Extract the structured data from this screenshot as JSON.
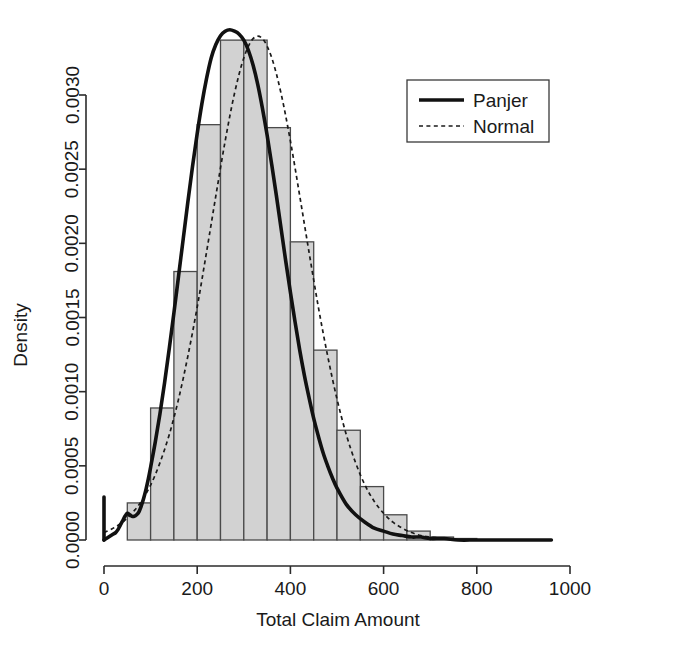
{
  "chart_data": {
    "type": "bar",
    "title": "",
    "xlabel": "Total Claim Amount",
    "ylabel": "Density",
    "xlim": [
      0,
      1000
    ],
    "ylim": [
      0,
      0.0034
    ],
    "grid": false,
    "legend_position": "top-right",
    "x_ticks": [
      0,
      200,
      400,
      600,
      800,
      1000
    ],
    "x_tick_labels": [
      "0",
      "200",
      "400",
      "600",
      "800",
      "1000"
    ],
    "y_ticks": [
      0.0,
      0.0005,
      0.001,
      0.0015,
      0.002,
      0.0025,
      0.003
    ],
    "y_tick_labels": [
      "0.0000",
      "0.0005",
      "0.0010",
      "0.0015",
      "0.0020",
      "0.0025",
      "0.0030"
    ],
    "bin_width": 50,
    "histogram": {
      "name": "Empirical histogram",
      "bin_edges": [
        0,
        50,
        100,
        150,
        200,
        250,
        300,
        350,
        400,
        450,
        500,
        550,
        600,
        650,
        700,
        750,
        800,
        850,
        900,
        950,
        1000
      ],
      "bin_starts": [
        0,
        50,
        100,
        150,
        200,
        250,
        300,
        350,
        400,
        450,
        500,
        550,
        600,
        650,
        700,
        750,
        800,
        850,
        900,
        950
      ],
      "densities": [
        0.0,
        0.00025,
        0.00089,
        0.00181,
        0.0028,
        0.00337,
        0.00337,
        0.00278,
        0.00201,
        0.00128,
        0.00074,
        0.00036,
        0.00017,
        6e-05,
        2e-05,
        1e-05,
        0.0,
        0.0,
        0.0,
        0.0
      ],
      "fill_color": "#d2d2d2",
      "edge_color": "#4a4a4a"
    },
    "series": [
      {
        "name": "Panjer",
        "style": "solid",
        "color": "#111111",
        "line_width": 3.6,
        "has_point_mass_at_zero": true,
        "point_mass_height": 0.00029,
        "x": [
          0,
          5,
          10,
          15,
          20,
          25,
          30,
          35,
          40,
          45,
          50,
          55,
          60,
          65,
          70,
          75,
          80,
          85,
          90,
          95,
          100,
          110,
          120,
          130,
          140,
          150,
          160,
          170,
          180,
          190,
          200,
          210,
          220,
          230,
          240,
          250,
          260,
          270,
          280,
          290,
          300,
          310,
          320,
          330,
          340,
          350,
          360,
          370,
          380,
          390,
          400,
          410,
          420,
          430,
          440,
          450,
          460,
          470,
          480,
          490,
          500,
          520,
          540,
          560,
          580,
          600,
          620,
          640,
          660,
          680,
          700,
          730,
          760,
          800,
          850,
          900,
          960
        ],
        "y": [
          0.0,
          1e-05,
          2e-05,
          3e-05,
          4e-05,
          5e-05,
          7e-05,
          0.0001,
          0.00013,
          0.00016,
          0.00018,
          0.00017,
          0.00016,
          0.00016,
          0.00017,
          0.00019,
          0.00023,
          0.00028,
          0.00034,
          0.00041,
          0.00049,
          0.00066,
          0.00085,
          0.00106,
          0.00129,
          0.00153,
          0.00178,
          0.00203,
          0.00228,
          0.00252,
          0.00274,
          0.00294,
          0.00311,
          0.00325,
          0.00334,
          0.0034,
          0.00343,
          0.00344,
          0.00343,
          0.00341,
          0.00337,
          0.0033,
          0.0032,
          0.00307,
          0.00291,
          0.00273,
          0.00253,
          0.00232,
          0.0021,
          0.00188,
          0.00167,
          0.00147,
          0.00128,
          0.00111,
          0.00096,
          0.00082,
          0.0007,
          0.00059,
          0.0005,
          0.00042,
          0.00035,
          0.00024,
          0.00017,
          0.00012,
          8e-05,
          6e-05,
          4e-05,
          3e-05,
          2e-05,
          2e-05,
          1e-05,
          1e-05,
          0.0,
          0.0,
          0.0,
          0.0,
          0.0
        ]
      },
      {
        "name": "Normal",
        "style": "dotted",
        "color": "#1a1a1a",
        "line_width": 1.7,
        "mean": 300,
        "sd": 120,
        "x": [
          0,
          20,
          40,
          60,
          80,
          100,
          120,
          140,
          160,
          180,
          200,
          220,
          240,
          260,
          280,
          300,
          320,
          340,
          360,
          380,
          400,
          420,
          440,
          460,
          480,
          500,
          520,
          540,
          560,
          580,
          600,
          620,
          640,
          660,
          680,
          700,
          730,
          760,
          800,
          850,
          900,
          960
        ],
        "y": [
          5e-05,
          8e-05,
          0.00012,
          0.00018,
          0.00026,
          0.00037,
          0.00052,
          0.00071,
          0.00095,
          0.00124,
          0.00157,
          0.00194,
          0.00232,
          0.00269,
          0.00301,
          0.00325,
          0.00338,
          0.00338,
          0.00325,
          0.00301,
          0.00269,
          0.00232,
          0.00194,
          0.00157,
          0.00124,
          0.00095,
          0.00071,
          0.00052,
          0.00037,
          0.00026,
          0.00018,
          0.00012,
          8e-05,
          5e-05,
          3e-05,
          2e-05,
          1e-05,
          0.0,
          0.0,
          0.0,
          0.0,
          0.0
        ]
      }
    ]
  },
  "legend": {
    "items": [
      {
        "label": "Panjer",
        "style": "solid"
      },
      {
        "label": "Normal",
        "style": "dotted"
      }
    ]
  }
}
